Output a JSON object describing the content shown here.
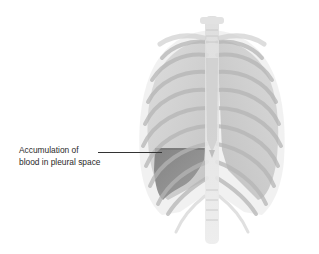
{
  "figure": {
    "condition_shown": "hemothorax"
  },
  "annotation": {
    "line1": "Accumulation of",
    "line2": "blood in pleural space"
  },
  "colors": {
    "background": "#ffffff",
    "bone": "#d8d8d8",
    "bone_edge": "#a9a9a9",
    "lung": "#c9c9c9",
    "blood": "#8a8a8a",
    "leader_line": "#333333",
    "text": "#2a2a2a"
  }
}
